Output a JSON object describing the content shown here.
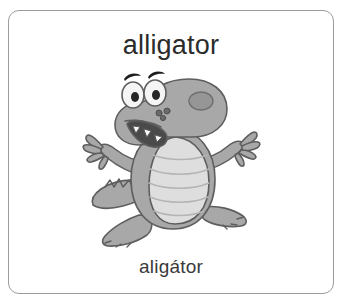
{
  "card": {
    "title": "alligator",
    "caption": "aligátor",
    "title_language": "english",
    "caption_language": "czech",
    "border_color": "#9c9c9c",
    "background_color": "#ffffff",
    "title_color": "#2b2b2b",
    "caption_color": "#3a3a3a"
  },
  "illustration": {
    "subject": "alligator-cartoon",
    "style": "grayscale-cartoon-clipart",
    "pose": "sitting-arms-raised",
    "colors": {
      "body": "#a8a8a8",
      "body_shadow": "#8e8e8e",
      "belly": "#dedede",
      "belly_line": "#b4b4b4",
      "outline": "#5e5e5e",
      "eye_white": "#f5f5f5",
      "pupil": "#262626",
      "eyebrow": "#1e1e1e",
      "mouth_inner": "#4a4a4a",
      "tooth": "#fbfbfb"
    },
    "parts": [
      "tail",
      "left-foot",
      "right-foot",
      "left-arm",
      "right-arm",
      "body",
      "belly",
      "head",
      "snout",
      "mouth",
      "teeth",
      "nostrils",
      "eyes",
      "eyebrows"
    ]
  }
}
